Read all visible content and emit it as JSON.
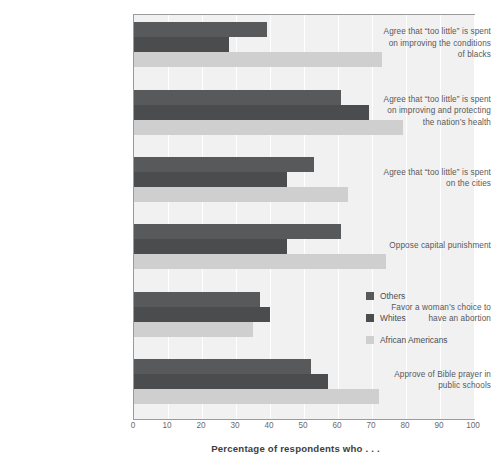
{
  "chart_data": {
    "type": "bar",
    "orientation": "horizontal",
    "title": "",
    "xlabel": "Percentage of respondents who . . .",
    "ylabel": "",
    "xlim": [
      0,
      100
    ],
    "xticks": [
      0,
      10,
      20,
      30,
      40,
      50,
      60,
      70,
      80,
      90,
      100
    ],
    "xtick_labels": [
      "0",
      "10",
      "20",
      "30",
      "40",
      "50",
      "60",
      "70",
      "80",
      "90",
      "100"
    ],
    "grid": true,
    "grid_axis": "x",
    "legend_position": "middle-right-inside",
    "categories": [
      "Agree that “too little” is spent on improving the conditions of blacks",
      "Agree that “too little” is spent on improving and protecting the nation’s health",
      "Agree that “too little” is spent on the cities",
      "Oppose capital punishment",
      "Favor a woman’s choice to have an abortion",
      "Approve of Bible prayer in public schools"
    ],
    "category_lines": [
      [
        "Agree that “too little” is spent",
        "on improving the conditions",
        "of blacks"
      ],
      [
        "Agree that “too little” is spent",
        "on improving and protecting",
        "the nation’s health"
      ],
      [
        "Agree that “too little” is spent",
        "on the cities"
      ],
      [
        "Oppose capital punishment"
      ],
      [
        "Favor a woman’s choice to",
        "have an abortion"
      ],
      [
        "Approve of Bible prayer in",
        "public schools"
      ]
    ],
    "series": [
      {
        "name": "Others",
        "color": "#58595b",
        "values": [
          39,
          61,
          53,
          61,
          37,
          52
        ]
      },
      {
        "name": "Whites",
        "color": "#4b4c4e",
        "values": [
          28,
          69,
          45,
          45,
          40,
          57
        ]
      },
      {
        "name": "African Americans",
        "color": "#cfcfcf",
        "values": [
          73,
          79,
          63,
          74,
          35,
          72
        ]
      }
    ]
  },
  "legend": {
    "items": [
      {
        "label": "Others"
      },
      {
        "label": "Whites"
      },
      {
        "label": "African Americans"
      }
    ]
  },
  "axis": {
    "x_title": "Percentage of respondents who . . ."
  },
  "colors": {
    "plot_background": "#f1f1f1",
    "plot_border": "#9b9b9b",
    "gridline": "#ffffff",
    "others": "#58595b",
    "whites": "#4b4c4e",
    "african_americans": "#cfcfcf",
    "text": "#58595b"
  }
}
